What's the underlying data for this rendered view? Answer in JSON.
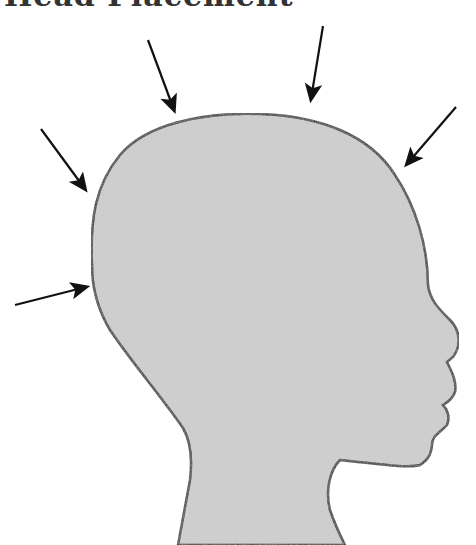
{
  "title": "Head Placement",
  "colors": {
    "head_fill": "#c9c9c9",
    "outline": "#111111",
    "arrow": "#111111",
    "background": "#ffffff"
  },
  "diagram": {
    "arrows": [
      {
        "id": "arrow-top-left",
        "from": [
          148,
          40
        ],
        "to": [
          176,
          115
        ]
      },
      {
        "id": "arrow-top",
        "from": [
          323,
          26
        ],
        "to": [
          310,
          104
        ]
      },
      {
        "id": "arrow-upper-left",
        "from": [
          41,
          129
        ],
        "to": [
          88,
          193
        ]
      },
      {
        "id": "arrow-right",
        "from": [
          456,
          107
        ],
        "to": [
          404,
          168
        ]
      },
      {
        "id": "arrow-left",
        "from": [
          15,
          305
        ],
        "to": [
          91,
          286
        ]
      }
    ]
  }
}
